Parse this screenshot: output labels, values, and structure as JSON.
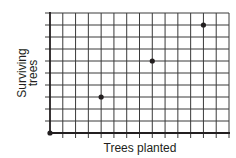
{
  "chart_data": {
    "type": "scatter",
    "title": "",
    "xlabel": "Trees planted",
    "ylabel": [
      "Surviving",
      "trees"
    ],
    "grid": true,
    "x_gridlines": 14,
    "y_gridlines": 10,
    "xlim": [
      0,
      14
    ],
    "ylim": [
      0,
      10
    ],
    "tick_labels_shown": false,
    "points": [
      {
        "x": 0,
        "y": 0
      },
      {
        "x": 4,
        "y": 3
      },
      {
        "x": 8,
        "y": 6
      },
      {
        "x": 12,
        "y": 9
      }
    ],
    "colors": {
      "grid": "#3a3a3a",
      "axis": "#231f20",
      "point": "#231f20",
      "background": "#ffffff"
    }
  }
}
